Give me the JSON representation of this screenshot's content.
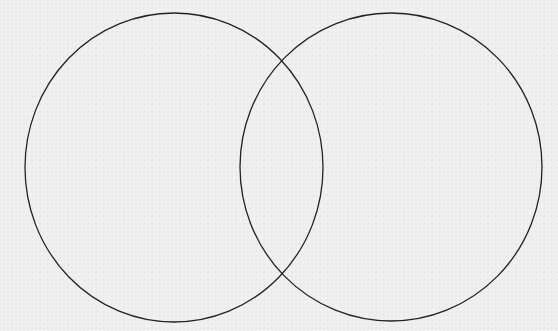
{
  "diagram": {
    "type": "venn",
    "set_count": 2,
    "background_color": "#ededed",
    "stroke_color": "#222222",
    "stroke_width": 1.3,
    "labels": [],
    "sets": [
      {
        "id": "set-a",
        "label": "",
        "cx": 174,
        "cy": 167.5,
        "rx": 149,
        "ry": 154.5
      },
      {
        "id": "set-b",
        "label": "",
        "cx": 391,
        "cy": 167,
        "rx": 151,
        "ry": 154
      }
    ],
    "intersections": [
      {
        "x": 282,
        "y": 60
      },
      {
        "x": 282,
        "y": 274
      }
    ]
  }
}
